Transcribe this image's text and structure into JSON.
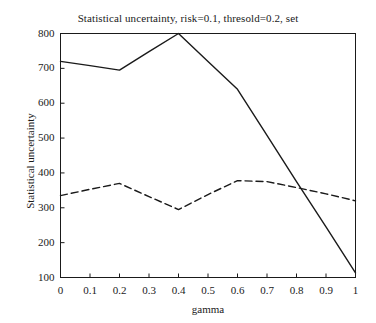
{
  "chart_data": {
    "type": "line",
    "title": "Statistical uncertainty, risk=0.1, thresold=0.2, set",
    "xlabel": "gamma",
    "ylabel": "Statistical uncertainty",
    "x": [
      0,
      0.1,
      0.2,
      0.3,
      0.4,
      0.5,
      0.6,
      0.7,
      0.8,
      0.9,
      1
    ],
    "xlim": [
      0,
      1
    ],
    "ylim": [
      100,
      800
    ],
    "xticks": [
      "0",
      "0.1",
      "0.2",
      "0.3",
      "0.4",
      "0.5",
      "0.6",
      "0.7",
      "0.8",
      "0.9",
      "1"
    ],
    "yticks": [
      "100",
      "200",
      "300",
      "400",
      "500",
      "600",
      "700",
      "800"
    ],
    "grid": false,
    "legend": "none",
    "series": [
      {
        "name": "solid-series",
        "style": "solid",
        "color": "#1a1a1a",
        "values": [
          720,
          708,
          695,
          748,
          800,
          720,
          640,
          508,
          375,
          245,
          113
        ]
      },
      {
        "name": "dashed-series",
        "style": "dashed",
        "color": "#1a1a1a",
        "values": [
          335,
          353,
          370,
          332,
          295,
          338,
          378,
          375,
          358,
          340,
          320
        ]
      }
    ]
  },
  "axes": {
    "x_min": 0,
    "x_max": 1,
    "y_min": 100,
    "y_max": 800
  }
}
